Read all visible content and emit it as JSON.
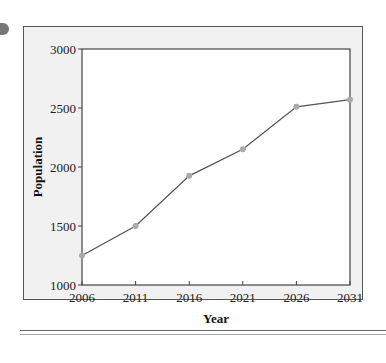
{
  "chart_data": {
    "type": "line",
    "title": "",
    "xlabel": "Year",
    "ylabel": "Population",
    "x": [
      2006,
      2011,
      2016,
      2021,
      2026,
      2031
    ],
    "categories": [
      "2006",
      "2011",
      "2016",
      "2021",
      "2026",
      "2031"
    ],
    "series": [
      {
        "name": "Population",
        "values": [
          1250,
          1500,
          1925,
          2150,
          2510,
          2570
        ]
      }
    ],
    "ylim": [
      1000,
      3000
    ],
    "yticks": [
      "1000",
      "1500",
      "2000",
      "2500",
      "3000"
    ],
    "xticks": [
      "2006",
      "2011",
      "2016",
      "2021",
      "2026",
      "2031"
    ],
    "grid": false,
    "legend": null,
    "colors": {
      "line": "#555555",
      "marker": "#aaaaaa",
      "frame_bg": "#f1f1f1",
      "plot_bg": "#ffffff"
    }
  },
  "axes": {
    "xlabel": "Year",
    "ylabel": "Population",
    "yticks": [
      "1000",
      "1500",
      "2000",
      "2500",
      "3000"
    ],
    "xticks": [
      "2006",
      "2011",
      "2016",
      "2021",
      "2026",
      "2031"
    ]
  }
}
